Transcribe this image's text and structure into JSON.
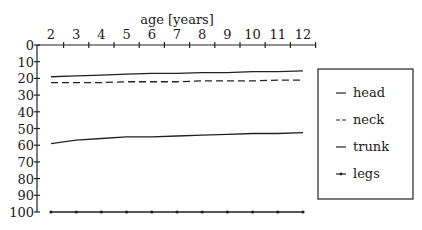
{
  "chart_data": {
    "type": "line",
    "title": "",
    "xlabel": "age [years]",
    "ylabel": "",
    "x": [
      2,
      3,
      4,
      5,
      6,
      7,
      8,
      9,
      10,
      11,
      12
    ],
    "xlim": [
      1,
      12.5
    ],
    "x_ticks": [
      2,
      3,
      4,
      5,
      6,
      7,
      8,
      9,
      10,
      11,
      12
    ],
    "x_axis_position": "top",
    "ylim": [
      0,
      100
    ],
    "y_inverted": true,
    "y_ticks": [
      0,
      10,
      20,
      30,
      40,
      50,
      60,
      70,
      80,
      90,
      100
    ],
    "grid": false,
    "legend_position": "right",
    "series": [
      {
        "name": "head",
        "style": "solid",
        "values": [
          19,
          18.5,
          18,
          17.5,
          17,
          17,
          16.5,
          16.5,
          16,
          16,
          15.5
        ]
      },
      {
        "name": "neck",
        "style": "dashed",
        "values": [
          22.5,
          22.5,
          22.5,
          22,
          22,
          22,
          21.5,
          21.5,
          21.5,
          21,
          21
        ]
      },
      {
        "name": "trunk",
        "style": "solid",
        "values": [
          59,
          57,
          56,
          55,
          55,
          54.5,
          54,
          53.5,
          53,
          53,
          52.5
        ]
      },
      {
        "name": "legs",
        "style": "dot-marked",
        "values": [
          100,
          100,
          100,
          100,
          100,
          100,
          100,
          100,
          100,
          100,
          100
        ]
      }
    ]
  },
  "legend": {
    "entries": [
      {
        "label": "head",
        "marker": "--"
      },
      {
        "label": "neck",
        "marker": "--"
      },
      {
        "label": "trunk",
        "marker": "—"
      },
      {
        "label": "legs",
        "marker": "-+-"
      }
    ]
  }
}
